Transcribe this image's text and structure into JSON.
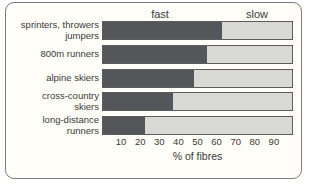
{
  "figure": {
    "background": "#fffef8",
    "frame_border_color": "#797b7d",
    "fast_color": "#54565a",
    "slow_color": "#d8d9d5"
  },
  "header": {
    "fast_label": "fast",
    "slow_label": "slow"
  },
  "rows": [
    {
      "line1": "sprinters, throwers",
      "line2": "jumpers"
    },
    {
      "line1": "800m runners",
      "line2": ""
    },
    {
      "line1": "alpine skiers",
      "line2": ""
    },
    {
      "line1": "cross-country",
      "line2": "skiers"
    },
    {
      "line1": "long-distance",
      "line2": "runners"
    }
  ],
  "axis": {
    "xlabel": "% of fibres"
  },
  "chart_data": {
    "type": "bar",
    "orientation": "horizontal",
    "stacked": true,
    "title": "",
    "xlabel": "% of fibres",
    "ylabel": "",
    "categories": [
      "sprinters, throwers jumpers",
      "800m runners",
      "alpine skiers",
      "cross-country skiers",
      "long-distance runners"
    ],
    "series": [
      {
        "name": "fast",
        "color": "#54565a",
        "values": [
          63,
          55,
          48,
          37,
          22
        ]
      },
      {
        "name": "slow",
        "color": "#d8d9d5",
        "values": [
          37,
          45,
          52,
          63,
          78
        ]
      }
    ],
    "xticks": [
      10,
      20,
      30,
      40,
      50,
      60,
      70,
      80,
      90
    ],
    "xlim": [
      0,
      100
    ],
    "grid": false,
    "legend_position": "top"
  }
}
